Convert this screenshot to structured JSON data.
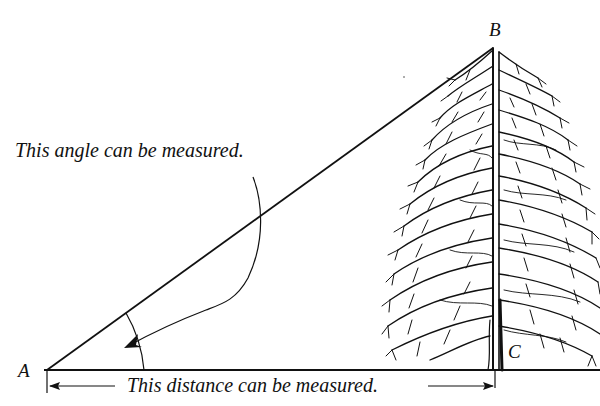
{
  "diagram": {
    "type": "right-triangle measurement illustration",
    "points": {
      "A": {
        "label": "A",
        "x": 47,
        "y": 370
      },
      "B": {
        "label": "B",
        "x": 493,
        "y": 48
      },
      "C": {
        "label": "C",
        "x": 496,
        "y": 370
      }
    },
    "annotations": {
      "angle_note": "This angle can be measured.",
      "distance_note": "This distance can be measured."
    },
    "colors": {
      "ink": "#111111",
      "background": "#ffffff"
    },
    "objects": {
      "tree": "conifer-tree-icon"
    }
  }
}
